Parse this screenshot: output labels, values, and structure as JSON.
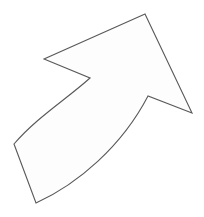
{
  "canvas": {
    "width": 204,
    "height": 217,
    "background_color": "#ffffff",
    "title": "Curved Arrow Outline"
  },
  "figure": {
    "name": "curved-arrow",
    "fill_color": "#fdfdfd",
    "stroke_color": "#595959",
    "stroke_width": 1.1,
    "direction": "up-right",
    "path": "M 145 14 L 44 59 L 90 78 C 68 98 36 118 14 144 L 36 203 C 78 184 122 146 148 96 L 192 113 Z",
    "vertices": [
      {
        "name": "arrowhead-apex",
        "x": 145,
        "y": 14
      },
      {
        "name": "arrowhead-left-barb",
        "x": 44,
        "y": 59
      },
      {
        "name": "inner-notch-upper",
        "x": 90,
        "y": 78
      },
      {
        "name": "tail-inner-corner",
        "x": 14,
        "y": 144
      },
      {
        "name": "tail-outer-corner",
        "x": 36,
        "y": 203
      },
      {
        "name": "inner-notch-lower",
        "x": 148,
        "y": 96
      },
      {
        "name": "arrowhead-right-barb",
        "x": 192,
        "y": 113
      }
    ],
    "curves": [
      {
        "name": "inner-concave-arc",
        "from": {
          "x": 90,
          "y": 78
        },
        "control_1": {
          "x": 68,
          "y": 98
        },
        "control_2": {
          "x": 36,
          "y": 118
        },
        "to": {
          "x": 14,
          "y": 144
        },
        "midpoint": {
          "x": 48,
          "y": 122
        }
      },
      {
        "name": "outer-convex-arc",
        "from": {
          "x": 36,
          "y": 203
        },
        "control_1": {
          "x": 78,
          "y": 184
        },
        "control_2": {
          "x": 122,
          "y": 146
        },
        "to": {
          "x": 148,
          "y": 96
        },
        "midpoint": {
          "x": 115,
          "y": 165
        }
      }
    ]
  }
}
